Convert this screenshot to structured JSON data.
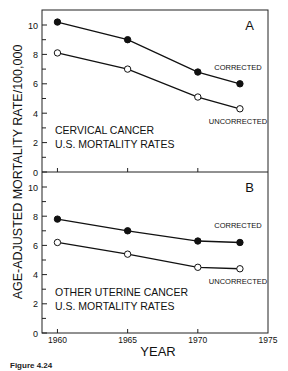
{
  "chart_data": [
    {
      "type": "line",
      "panel_label": "A",
      "title": "CERVICAL CANCER\nU.S. MORTALITY RATES",
      "title_lines": [
        "CERVICAL CANCER",
        "U.S. MORTALITY RATES"
      ],
      "xlabel": "YEAR",
      "ylabel": "AGE-ADJUSTED MORTALITY RATE/100,000",
      "x": [
        1960,
        1965,
        1970,
        1973
      ],
      "series": [
        {
          "name": "CORRECTED",
          "marker": "filled-circle",
          "values": [
            10.2,
            9.0,
            6.8,
            6.0
          ]
        },
        {
          "name": "UNCORRECTED",
          "marker": "open-circle",
          "values": [
            8.1,
            7.0,
            5.1,
            4.3
          ]
        }
      ],
      "ylim": [
        0,
        10
      ],
      "yticks": [
        0,
        2,
        4,
        6,
        8,
        10
      ],
      "xlim": [
        1960,
        1975
      ],
      "grid": false
    },
    {
      "type": "line",
      "panel_label": "B",
      "title": "OTHER UTERINE CANCER\nU.S. MORTALITY RATES",
      "title_lines": [
        "OTHER UTERINE CANCER",
        "U.S. MORTALITY RATES"
      ],
      "xlabel": "YEAR",
      "ylabel": "AGE-ADJUSTED MORTALITY RATE/100,000",
      "x": [
        1960,
        1965,
        1970,
        1973
      ],
      "series": [
        {
          "name": "CORRECTED",
          "marker": "filled-circle",
          "values": [
            7.8,
            7.0,
            6.3,
            6.2
          ]
        },
        {
          "name": "UNCORRECTED",
          "marker": "open-circle",
          "values": [
            6.2,
            5.4,
            4.5,
            4.4
          ]
        }
      ],
      "ylim": [
        0,
        10
      ],
      "yticks": [
        0,
        2,
        4,
        6,
        8,
        10
      ],
      "xticks": [
        1960,
        1965,
        1970,
        1975
      ],
      "xlim": [
        1960,
        1975
      ],
      "grid": false
    }
  ],
  "axes": {
    "ylabel": "AGE-ADJUSTED MORTALITY RATE/100,000",
    "xlabel": "YEAR",
    "ytick_labels": [
      "0",
      "2",
      "4",
      "6",
      "8",
      "10"
    ],
    "xtick_labels": [
      "1960",
      "1965",
      "1970",
      "1975"
    ]
  },
  "caption": "Figure 4.24"
}
